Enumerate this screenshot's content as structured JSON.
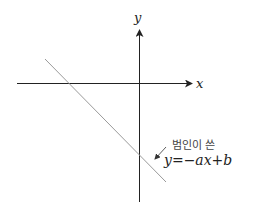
{
  "diagram": {
    "axes": {
      "x_label": "x",
      "y_label": "y"
    },
    "line": {
      "description": "decreasing line with negative slope and negative y-intercept"
    },
    "annotation": {
      "text_korean": "범인이 쓴",
      "equation": "y=−ax+b"
    },
    "colors": {
      "axis": "#222222",
      "line": "#9a9a9a",
      "text": "#333333"
    }
  }
}
